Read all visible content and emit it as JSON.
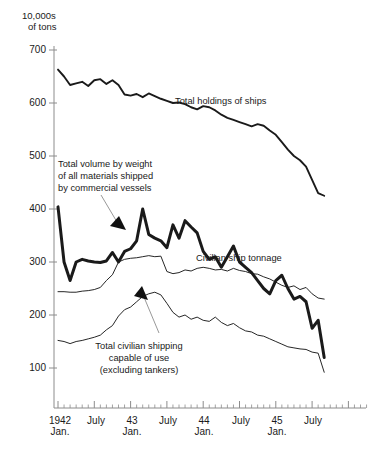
{
  "chart_data": {
    "type": "line",
    "title": "",
    "ylabel": "10,000s of tons",
    "xlabel": "",
    "grid": false,
    "legend_position": "inline-annotations",
    "ylim": [
      30,
      700
    ],
    "yticks": [
      100,
      200,
      300,
      400,
      500,
      600,
      700
    ],
    "ytick_labels": [
      "100",
      "200",
      "300",
      "400",
      "500",
      "600",
      "700"
    ],
    "xlim": [
      "1942-01",
      "1945-09"
    ],
    "xtick_labels": [
      {
        "label": "1942\nJan.",
        "x": 0
      },
      {
        "label": "July",
        "x": 6
      },
      {
        "label": "43\nJan.",
        "x": 12
      },
      {
        "label": "July",
        "x": 18
      },
      {
        "label": "44\nJan.",
        "x": 24
      },
      {
        "label": "July",
        "x": 30
      },
      {
        "label": "45\nJan.",
        "x": 36
      },
      {
        "label": "July",
        "x": 42
      }
    ],
    "x_minor_tick_interval_months": 1,
    "x_major_tick_interval_months": 6,
    "series": [
      {
        "name": "Total holdings of ships",
        "style": "medium",
        "values": [
          663,
          650,
          634,
          637,
          640,
          632,
          643,
          645,
          636,
          643,
          634,
          616,
          614,
          617,
          611,
          618,
          613,
          608,
          604,
          600,
          601,
          598,
          592,
          588,
          594,
          592,
          586,
          578,
          572,
          568,
          564,
          560,
          556,
          560,
          557,
          548,
          540,
          526,
          512,
          500,
          492,
          480,
          455,
          430,
          425
        ]
      },
      {
        "name": "Total volume by weight of all materials shipped by commercial vessels",
        "style": "bold",
        "values": [
          404,
          300,
          265,
          300,
          305,
          302,
          300,
          299,
          302,
          318,
          300,
          320,
          325,
          340,
          400,
          352,
          345,
          340,
          327,
          370,
          345,
          378,
          366,
          355,
          320,
          305,
          310,
          290,
          310,
          330,
          300,
          290,
          280,
          265,
          250,
          240,
          265,
          275,
          250,
          230,
          235,
          225,
          175,
          190,
          120
        ]
      },
      {
        "name": "Civilian ship tonnage",
        "style": "thin",
        "values": [
          244,
          244,
          243,
          243,
          245,
          246,
          248,
          252,
          265,
          276,
          300,
          305,
          307,
          308,
          310,
          312,
          310,
          311,
          282,
          278,
          280,
          285,
          283,
          288,
          290,
          288,
          285,
          286,
          283,
          288,
          284,
          282,
          278,
          277,
          272,
          268,
          262,
          256,
          252,
          255,
          248,
          252,
          240,
          232,
          230
        ]
      },
      {
        "name": "Total civilian shipping capable of use (excluding tankers)",
        "style": "thin",
        "values": [
          152,
          150,
          146,
          150,
          152,
          155,
          158,
          162,
          172,
          180,
          198,
          210,
          215,
          225,
          235,
          240,
          243,
          238,
          222,
          205,
          196,
          200,
          192,
          196,
          190,
          188,
          196,
          186,
          180,
          184,
          176,
          170,
          168,
          162,
          160,
          155,
          150,
          145,
          140,
          138,
          136,
          135,
          130,
          128,
          92
        ]
      }
    ],
    "annotations": [
      {
        "id": "total-holdings",
        "text": "Total holdings of ships",
        "target_series": "Total holdings of ships"
      },
      {
        "id": "total-volume",
        "text": "Total volume by weight\nof all materials shipped\nby commercial vessels",
        "target_series": "Total volume by weight of all materials shipped by commercial vessels"
      },
      {
        "id": "civilian-tonnage",
        "text": "Civilian ship tonnage",
        "target_series": "Civilian ship tonnage"
      },
      {
        "id": "civilian-capable",
        "text": "Total civilian shipping\ncapable of use\n(excluding tankers)",
        "target_series": "Total civilian shipping capable of use (excluding tankers)"
      }
    ]
  },
  "axis": {
    "header_line1": "10,000s",
    "header_line2": "of tons",
    "ytick_0": "700",
    "ytick_1": "600",
    "ytick_2": "500",
    "ytick_3": "400",
    "ytick_4": "300",
    "ytick_5": "200",
    "ytick_6": "100",
    "xtick_0": "1942\nJan.",
    "xtick_1": "July",
    "xtick_2": "43\nJan.",
    "xtick_3": "July",
    "xtick_4": "44\nJan.",
    "xtick_5": "July",
    "xtick_6": "45\nJan.",
    "xtick_7": "July"
  },
  "annotations": {
    "total_holdings": "Total holdings of ships",
    "total_volume": "Total volume by weight\nof all materials shipped\nby commercial vessels",
    "civilian_tonnage": "Civilian ship tonnage",
    "civilian_capable": "Total civilian shipping\ncapable of use\n(excluding tankers)"
  },
  "colors": {
    "line": "#1a1a1a",
    "axis": "#8c8c8c",
    "leader": "#8c8c8c",
    "background": "#ffffff"
  }
}
